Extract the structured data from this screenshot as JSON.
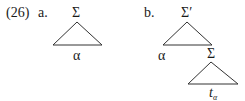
{
  "example_number": "(26)",
  "diagram_a": {
    "label": "a.",
    "root": "Σ",
    "leaf": "α"
  },
  "diagram_b": {
    "label": "b.",
    "root": "Σ′",
    "left_child": "α",
    "right_child": "Σ",
    "subtree_leaf_main": "t",
    "subtree_leaf_sub": "α"
  },
  "colors": {
    "ink": "#1a1a1a",
    "background": "#ffffff"
  }
}
